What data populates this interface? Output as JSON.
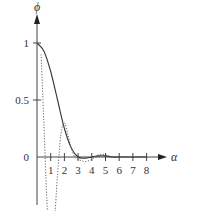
{
  "chart_data": {
    "type": "line",
    "title": "",
    "xlabel": "α",
    "ylabel": "ϕ",
    "xlim": [
      0,
      8.5
    ],
    "ylim": [
      -0.85,
      1.15
    ],
    "x_ticks": [
      "1",
      "2",
      "3",
      "4",
      "5",
      "6",
      "7",
      "8"
    ],
    "y_ticks": [
      "1",
      "0.5",
      "0",
      "−0.5"
    ],
    "grid": false,
    "legend": null,
    "series": [
      {
        "name": "solid",
        "style": "solid",
        "x": [
          0,
          0.5,
          1,
          1.5,
          2,
          2.5,
          3,
          3.5,
          4,
          4.5,
          5,
          5.5,
          6,
          6.5,
          7,
          7.5,
          8
        ],
        "values": [
          1,
          0.93,
          0.75,
          0.5,
          0.25,
          0.08,
          0.0,
          -0.01,
          0.0,
          0.01,
          0.01,
          0.0,
          0.0,
          0.0,
          0.0,
          0.0,
          0.0
        ]
      },
      {
        "name": "dotted",
        "style": "dotted",
        "x": [
          0.3,
          0.5,
          0.75,
          1,
          1.25,
          1.5,
          1.75,
          2,
          2.25,
          2.5,
          2.75,
          3,
          3.5,
          4,
          4.5,
          5,
          5.5,
          6
        ],
        "values": [
          0.9,
          0.3,
          -0.45,
          -0.75,
          -0.6,
          -0.15,
          0.2,
          0.3,
          0.2,
          0.08,
          0.0,
          -0.02,
          -0.04,
          -0.02,
          0.02,
          0.02,
          0.0,
          0.0
        ]
      }
    ]
  }
}
